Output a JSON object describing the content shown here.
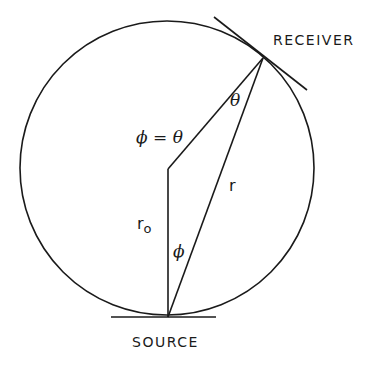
{
  "diagram": {
    "labels": {
      "receiver": "RECEIVER",
      "source": "SOURCE",
      "phi_equals_theta": "ϕ = θ",
      "theta": "θ",
      "r": "r",
      "r0": "r",
      "r0_sub": "o",
      "phi": "ϕ"
    },
    "colors": {
      "stroke": "#1a1a1a",
      "background": "#ffffff"
    },
    "geometry": {
      "circle_center": [
        167,
        168
      ],
      "circle_radius": 147,
      "source_point": [
        168,
        317
      ],
      "receiver_point": [
        263,
        58
      ],
      "vertex_point": [
        168,
        169
      ]
    }
  }
}
